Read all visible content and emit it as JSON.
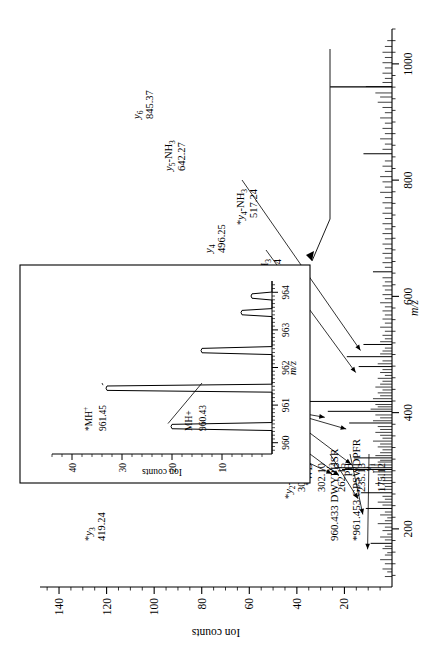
{
  "figure": {
    "kind": "mass-spectrum",
    "rotation_deg": -90,
    "annotations": {
      "sequence_1": "960.433 DWYPHSR",
      "sequence_2": "*961.453 GPSWDPFR"
    }
  },
  "chart_data": {
    "type": "bar",
    "title": "",
    "xlabel": "m/z",
    "ylabel": "Ion counts",
    "xlim": [
      100,
      1060
    ],
    "ylim": [
      0,
      148
    ],
    "grid": false,
    "legend": false,
    "x_ticks": [
      200,
      400,
      600,
      800,
      1000
    ],
    "y_ticks": [
      20,
      40,
      60,
      80,
      100,
      120,
      140
    ],
    "x_minor_step": 20,
    "y_minor_step": 5,
    "labelled_peaks": [
      {
        "mz": 175.12,
        "intensity": 9,
        "label": "y1",
        "sub": "1",
        "value": "175.12",
        "star": false
      },
      {
        "mz": 235.13,
        "intensity": 11,
        "label": "PH",
        "sub": "",
        "value": "235.13",
        "star": false
      },
      {
        "mz": 262.15,
        "intensity": 13,
        "label": "y2",
        "sub": "2",
        "value": "262.15",
        "star": false
      },
      {
        "mz": 302.1,
        "intensity": 21,
        "label": "*WD",
        "sub": "",
        "value": "302.10",
        "star": true
      },
      {
        "mz": 305.15,
        "intensity": 24,
        "label": "*y2-NH3",
        "sub": "2",
        "value": "305.15",
        "star": true
      },
      {
        "mz": 322.1,
        "intensity": 16,
        "label": "*y2",
        "sub": "2",
        "value": "322.10",
        "star": true
      },
      {
        "mz": 382.17,
        "intensity": 18,
        "label": "y3-NH3",
        "sub": "3",
        "value": "382.17",
        "star": false
      },
      {
        "mz": 402.22,
        "intensity": 27,
        "label": "*y3-NH3",
        "sub": "3",
        "value": "402.22",
        "star": true
      },
      {
        "mz": 419.24,
        "intensity": 141,
        "label": "*y3",
        "sub": "3",
        "value": "419.24",
        "star": true
      },
      {
        "mz": 479.24,
        "intensity": 14,
        "label": "y4-NH3",
        "sub": "4",
        "value": "479.24",
        "star": false
      },
      {
        "mz": 496.25,
        "intensity": 19,
        "label": "y4",
        "sub": "4",
        "value": "496.25",
        "star": false
      },
      {
        "mz": 517.24,
        "intensity": 12,
        "label": "*y4-NH3",
        "sub": "4",
        "value": "517.24",
        "star": true
      },
      {
        "mz": 642.27,
        "intensity": 8,
        "label": "y5-NH3",
        "sub": "5",
        "value": "642.27",
        "star": false
      },
      {
        "mz": 845.37,
        "intensity": 12,
        "label": "y6",
        "sub": "6",
        "value": "845.37",
        "star": false
      }
    ],
    "unlabelled_peaks": [
      [
        118,
        3
      ],
      [
        126,
        2
      ],
      [
        131,
        4
      ],
      [
        140,
        3
      ],
      [
        147,
        5
      ],
      [
        155,
        3
      ],
      [
        159,
        2
      ],
      [
        166,
        4
      ],
      [
        170,
        3
      ],
      [
        181,
        3
      ],
      [
        186,
        5
      ],
      [
        191,
        2
      ],
      [
        197,
        4
      ],
      [
        203,
        3
      ],
      [
        209,
        6
      ],
      [
        214,
        3
      ],
      [
        219,
        2
      ],
      [
        224,
        5
      ],
      [
        229,
        3
      ],
      [
        241,
        4
      ],
      [
        246,
        6
      ],
      [
        251,
        3
      ],
      [
        256,
        4
      ],
      [
        268,
        5
      ],
      [
        273,
        3
      ],
      [
        278,
        7
      ],
      [
        283,
        4
      ],
      [
        288,
        5
      ],
      [
        293,
        6
      ],
      [
        298,
        8
      ],
      [
        310,
        9
      ],
      [
        315,
        6
      ],
      [
        318,
        5
      ],
      [
        326,
        7
      ],
      [
        331,
        5
      ],
      [
        336,
        4
      ],
      [
        341,
        6
      ],
      [
        346,
        5
      ],
      [
        351,
        8
      ],
      [
        356,
        4
      ],
      [
        361,
        5
      ],
      [
        366,
        7
      ],
      [
        371,
        5
      ],
      [
        376,
        6
      ],
      [
        386,
        8
      ],
      [
        391,
        5
      ],
      [
        396,
        7
      ],
      [
        406,
        9
      ],
      [
        410,
        6
      ],
      [
        414,
        7
      ],
      [
        424,
        8
      ],
      [
        429,
        5
      ],
      [
        434,
        6
      ],
      [
        439,
        4
      ],
      [
        444,
        7
      ],
      [
        449,
        5
      ],
      [
        454,
        4
      ],
      [
        459,
        6
      ],
      [
        464,
        3
      ],
      [
        469,
        5
      ],
      [
        474,
        4
      ],
      [
        484,
        6
      ],
      [
        489,
        4
      ],
      [
        501,
        5
      ],
      [
        506,
        4
      ],
      [
        511,
        3
      ],
      [
        522,
        5
      ],
      [
        527,
        3
      ],
      [
        533,
        4
      ],
      [
        540,
        3
      ],
      [
        547,
        5
      ],
      [
        554,
        3
      ],
      [
        561,
        4
      ],
      [
        568,
        3
      ],
      [
        575,
        4
      ],
      [
        582,
        3
      ],
      [
        589,
        5
      ],
      [
        596,
        3
      ],
      [
        603,
        4
      ],
      [
        611,
        3
      ],
      [
        618,
        4
      ],
      [
        625,
        3
      ],
      [
        632,
        4
      ],
      [
        650,
        3
      ],
      [
        658,
        4
      ],
      [
        666,
        3
      ],
      [
        674,
        4
      ],
      [
        682,
        3
      ],
      [
        690,
        4
      ],
      [
        699,
        3
      ],
      [
        708,
        4
      ],
      [
        716,
        3
      ],
      [
        725,
        4
      ],
      [
        734,
        3
      ],
      [
        743,
        4
      ],
      [
        752,
        3
      ],
      [
        761,
        4
      ],
      [
        770,
        3
      ],
      [
        779,
        5
      ],
      [
        788,
        3
      ],
      [
        797,
        4
      ],
      [
        806,
        5
      ],
      [
        815,
        3
      ],
      [
        824,
        4
      ],
      [
        833,
        3
      ],
      [
        853,
        4
      ],
      [
        862,
        3
      ],
      [
        871,
        5
      ],
      [
        880,
        3
      ],
      [
        889,
        4
      ],
      [
        898,
        3
      ],
      [
        907,
        5
      ],
      [
        916,
        3
      ],
      [
        925,
        4
      ],
      [
        934,
        6
      ],
      [
        943,
        5
      ],
      [
        950,
        7
      ],
      [
        961,
        11
      ],
      [
        968,
        4
      ],
      [
        975,
        3
      ],
      [
        984,
        4
      ],
      [
        993,
        3
      ],
      [
        1002,
        4
      ],
      [
        1011,
        3
      ],
      [
        1020,
        4
      ],
      [
        1030,
        3
      ],
      [
        1040,
        2
      ]
    ],
    "base_peak": {
      "mz": 960.4,
      "intensity": 26
    }
  },
  "inset": {
    "xlabel": "m/z",
    "ylabel": "Ion counts",
    "x_ticks": [
      960,
      961,
      962,
      963,
      964
    ],
    "y_ticks": [
      10,
      20,
      30,
      40
    ],
    "xlim": [
      959.7,
      964.3
    ],
    "ylim": [
      0,
      44
    ],
    "peaks": [
      {
        "mz": 960.43,
        "intensity": 20,
        "label": "MH+",
        "value": "960.43"
      },
      {
        "mz": 961.45,
        "intensity": 33,
        "label": "*MH+",
        "value": "961.45"
      },
      {
        "mz": 962.45,
        "intensity": 14,
        "label": "",
        "value": ""
      },
      {
        "mz": 963.46,
        "intensity": 6,
        "label": "",
        "value": ""
      },
      {
        "mz": 963.9,
        "intensity": 4,
        "label": "",
        "value": ""
      }
    ],
    "callout_label_1": "*MH",
    "callout_sup_1": "+",
    "callout_val_1": "961.45",
    "callout_label_2": "MH+",
    "callout_val_2": "960.43"
  }
}
